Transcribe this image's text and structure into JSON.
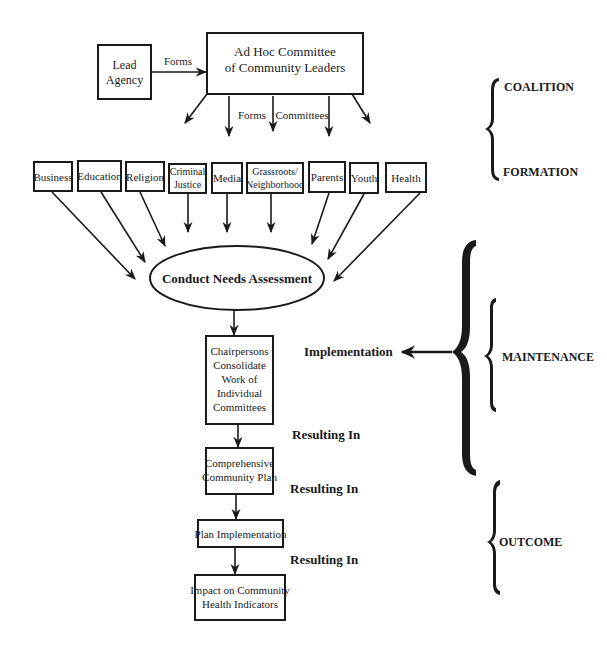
{
  "diagram": {
    "lead_agency": {
      "line1": "Lead",
      "line2": "Agency"
    },
    "forms_label_1": "Forms",
    "ad_hoc": {
      "line1": "Ad Hoc Committee",
      "line2": "of Community Leaders"
    },
    "forms_label_2": "Forms",
    "committees_label": "Committees",
    "committees": [
      {
        "line1": "Business"
      },
      {
        "line1": "Education"
      },
      {
        "line1": "Religion"
      },
      {
        "line1": "Criminal",
        "line2": "Justice"
      },
      {
        "line1": "Media"
      },
      {
        "line1": "Grassroots/",
        "line2": "Neighborhood"
      },
      {
        "line1": "Parents"
      },
      {
        "line1": "Youth"
      },
      {
        "line1": "Health"
      }
    ],
    "needs_assessment": "Conduct Needs Assessment",
    "chairpersons": [
      "Chairpersons",
      "Consolidate",
      "Work of",
      "Individual",
      "Committees"
    ],
    "implementation_label": "Implementation",
    "resulting_in_1": "Resulting In",
    "comprehensive_plan": {
      "line1": "Comprehensive",
      "line2": "Community Plan"
    },
    "resulting_in_2": "Resulting In",
    "plan_implementation": "Plan Implementation",
    "resulting_in_3": "Resulting In",
    "impact": {
      "line1": "Impact on Community",
      "line2": "Health Indicators"
    }
  },
  "phases": {
    "coalition": "COALITION",
    "formation": "FORMATION",
    "maintenance": "MAINTENANCE",
    "outcome": "OUTCOME"
  }
}
